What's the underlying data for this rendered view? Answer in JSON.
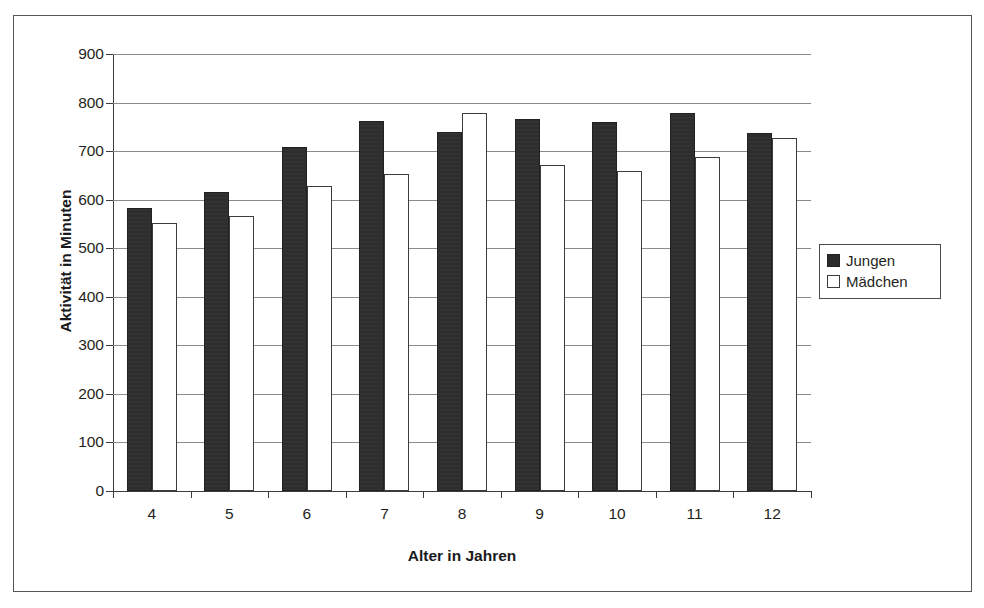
{
  "chart_data": {
    "type": "bar",
    "title": "",
    "xlabel": "Alter in Jahren",
    "ylabel": "Aktivität in Minuten",
    "categories": [
      "4",
      "5",
      "6",
      "7",
      "8",
      "9",
      "10",
      "11",
      "12"
    ],
    "series": [
      {
        "name": "Jungen",
        "color": "#2b2b2b",
        "values": [
          583,
          615,
          708,
          762,
          740,
          766,
          760,
          778,
          738
        ]
      },
      {
        "name": "Mädchen",
        "color": "#ffffff",
        "values": [
          552,
          566,
          628,
          653,
          778,
          671,
          659,
          687,
          728
        ]
      }
    ],
    "ylim": [
      0,
      900
    ],
    "ytick_step": 100,
    "yticks": [
      "0",
      "100",
      "200",
      "300",
      "400",
      "500",
      "600",
      "700",
      "800",
      "900"
    ],
    "grid": "horizontal",
    "legend_position": "right"
  },
  "legend": {
    "items": [
      {
        "label": "Jungen",
        "swatch": "filled-dark-square"
      },
      {
        "label": "Mädchen",
        "swatch": "outlined-white-square"
      }
    ]
  }
}
